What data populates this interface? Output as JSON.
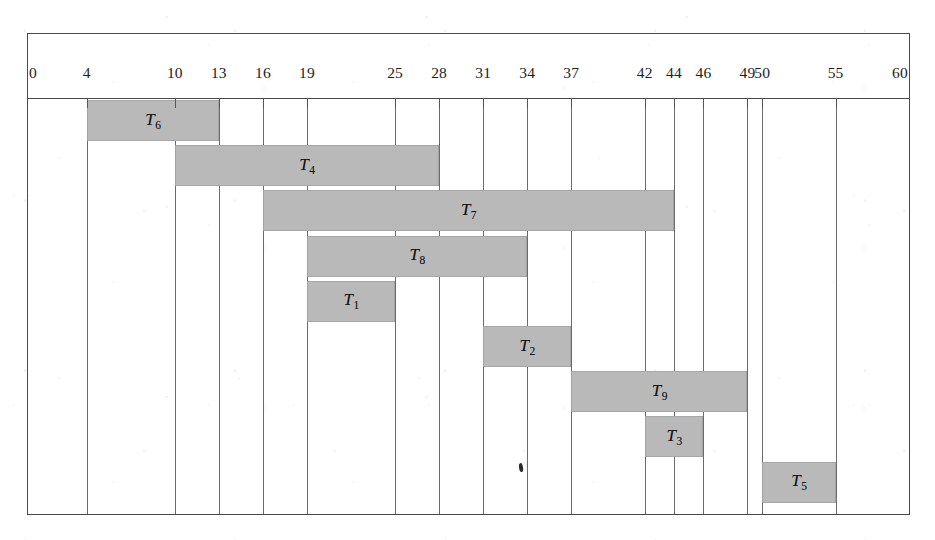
{
  "chart_data": {
    "type": "bar",
    "subtype": "gantt",
    "title": "",
    "xlabel": "",
    "ylabel": "",
    "xlim": [
      0,
      60
    ],
    "grid": true,
    "legend": null,
    "axis_ticks": [
      0,
      4,
      10,
      13,
      16,
      19,
      25,
      28,
      31,
      34,
      37,
      42,
      44,
      46,
      49,
      50,
      55,
      60
    ],
    "tick_labels": [
      "0",
      "4",
      "10",
      "13",
      "16",
      "19",
      "25",
      "28",
      "31",
      "34",
      "37",
      "42",
      "44",
      "46",
      "49",
      "50",
      "55",
      "60"
    ],
    "categories": [
      "T6",
      "T4",
      "T7",
      "T8",
      "T1",
      "T2",
      "T9",
      "T3",
      "T5"
    ],
    "bar_color": "#b9b9b9",
    "tasks": [
      {
        "label": "T",
        "sub": "6",
        "name": "T6",
        "start": 4,
        "end": 13,
        "duration": 9,
        "row": 0
      },
      {
        "label": "T",
        "sub": "4",
        "name": "T4",
        "start": 10,
        "end": 28,
        "duration": 18,
        "row": 1
      },
      {
        "label": "T",
        "sub": "7",
        "name": "T7",
        "start": 16,
        "end": 44,
        "duration": 28,
        "row": 2
      },
      {
        "label": "T",
        "sub": "8",
        "name": "T8",
        "start": 19,
        "end": 34,
        "duration": 15,
        "row": 3
      },
      {
        "label": "T",
        "sub": "1",
        "name": "T1",
        "start": 19,
        "end": 25,
        "duration": 6,
        "row": 4
      },
      {
        "label": "T",
        "sub": "2",
        "name": "T2",
        "start": 31,
        "end": 37,
        "duration": 6,
        "row": 5
      },
      {
        "label": "T",
        "sub": "9",
        "name": "T9",
        "start": 37,
        "end": 49,
        "duration": 12,
        "row": 6
      },
      {
        "label": "T",
        "sub": "3",
        "name": "T3",
        "start": 42,
        "end": 46,
        "duration": 4,
        "row": 7
      },
      {
        "label": "T",
        "sub": "5",
        "name": "T5",
        "start": 50,
        "end": 55,
        "duration": 5,
        "row": 8
      }
    ]
  }
}
